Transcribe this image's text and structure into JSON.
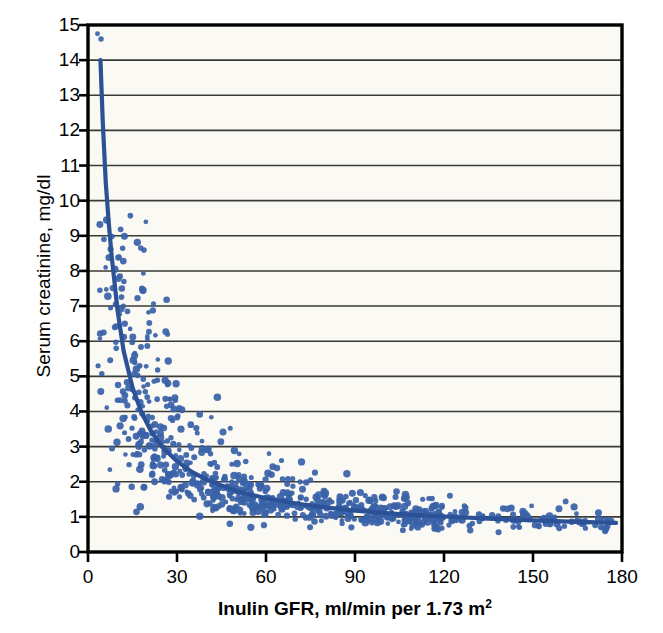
{
  "chart_data": {
    "type": "scatter",
    "title": "",
    "xlabel": "Inulin GFR, ml/min per 1.73 m",
    "xlabel_sup": "2",
    "ylabel": "Serum creatinine, mg/dl",
    "xlim": [
      0,
      180
    ],
    "ylim": [
      0,
      15
    ],
    "xticks": [
      0,
      30,
      60,
      90,
      120,
      150,
      180
    ],
    "yticks": [
      0,
      1,
      2,
      3,
      4,
      5,
      6,
      7,
      8,
      9,
      10,
      11,
      12,
      13,
      14,
      15
    ],
    "grid": "horizontal",
    "legend": "none",
    "marker_color": "#3A62A8",
    "curve_color": "#2B5196",
    "axis_color": "#000000",
    "grid_color": "#3A3A36",
    "plot_background": "#FAF9F4",
    "figure_background": "#FFFFFF",
    "marker_size_px": 5,
    "n_points": 820,
    "series": [
      {
        "name": "Measured GFR vs serum creatinine",
        "description": "Individual patient observations; serum creatinine falls hyperbolically as inulin GFR rises."
      }
    ],
    "fit_curve": {
      "name": "hyperbolic fit",
      "form": "Scr = a / GFR + b",
      "a": 63.0,
      "b": 0.48,
      "x_start": 4.2,
      "x_end": 178,
      "y_start": 14.0,
      "y_end": 0.83,
      "sample_points": [
        [
          4.2,
          14.0
        ],
        [
          5,
          12.2
        ],
        [
          6,
          10.5
        ],
        [
          7,
          9.36
        ],
        [
          8,
          8.4
        ],
        [
          10,
          6.85
        ],
        [
          12,
          5.73
        ],
        [
          15,
          4.68
        ],
        [
          18,
          3.98
        ],
        [
          21,
          3.48
        ],
        [
          25,
          2.99
        ],
        [
          30,
          2.58
        ],
        [
          35,
          2.28
        ],
        [
          40,
          2.06
        ],
        [
          50,
          1.73
        ],
        [
          60,
          1.53
        ],
        [
          70,
          1.38
        ],
        [
          80,
          1.27
        ],
        [
          90,
          1.18
        ],
        [
          100,
          1.11
        ],
        [
          110,
          1.05
        ],
        [
          120,
          1.01
        ],
        [
          135,
          0.95
        ],
        [
          150,
          0.9
        ],
        [
          165,
          0.86
        ],
        [
          178,
          0.83
        ]
      ]
    },
    "high_outliers": [
      [
        3.2,
        14.75
      ],
      [
        4.4,
        14.6
      ],
      [
        6.3,
        9.45
      ],
      [
        8.1,
        8.98
      ],
      [
        7.6,
        8.62
      ],
      [
        10.6,
        8.4
      ],
      [
        11.9,
        8.28
      ],
      [
        9.1,
        8.05
      ],
      [
        10.2,
        7.78
      ],
      [
        11.4,
        7.5
      ],
      [
        12.1,
        7.7
      ],
      [
        4.0,
        7.45
      ],
      [
        26.5,
        7.18
      ],
      [
        9.4,
        7.05
      ],
      [
        11.2,
        6.92
      ],
      [
        13.3,
        6.85
      ],
      [
        12.4,
        6.5
      ],
      [
        14.2,
        6.35
      ],
      [
        15.1,
        6.12
      ],
      [
        26.8,
        6.2
      ],
      [
        5.3,
        6.25
      ],
      [
        3.4,
        5.3
      ],
      [
        61,
        2.8
      ],
      [
        75,
        2.05
      ],
      [
        122,
        1.6
      ],
      [
        161,
        1.44
      ],
      [
        104,
        1.72
      ]
    ],
    "band_notes": {
      "low_gfr_spread": "At GFR < 30, creatinine ranges ~1.0 to 9.5 mg/dl with heavy scatter.",
      "high_gfr_band": "At GFR > 90, creatinine compresses into a narrow band ~0.6 to 1.4 mg/dl."
    }
  },
  "axes": {
    "y_tick_labels": [
      "15",
      "14",
      "13",
      "12",
      "11",
      "10",
      "9",
      "8",
      "7",
      "6",
      "5",
      "4",
      "3",
      "2",
      "1",
      "0"
    ],
    "x_tick_labels": [
      "0",
      "30",
      "60",
      "90",
      "120",
      "150",
      "180"
    ]
  }
}
